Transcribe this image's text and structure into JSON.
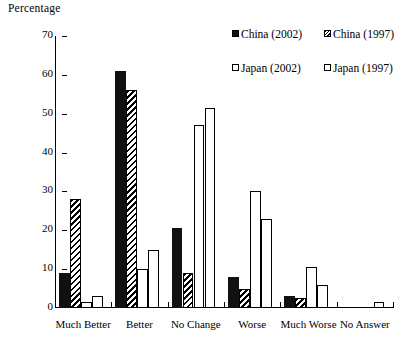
{
  "chart_data": {
    "type": "bar",
    "title": "",
    "ylabel": "Percentage",
    "xlabel": "",
    "ylim": [
      0,
      70
    ],
    "yticks": [
      0,
      10,
      20,
      30,
      40,
      50,
      60,
      70
    ],
    "grid": false,
    "legend_position": "top-right",
    "categories": [
      "Much Better",
      "Better",
      "No Change",
      "Worse",
      "Much Worse",
      "No Answer"
    ],
    "series": [
      {
        "name": "China (2002)",
        "pattern": "solid-black",
        "values": [
          9,
          61,
          20.5,
          8,
          3,
          0
        ]
      },
      {
        "name": "China (1997)",
        "pattern": "diagonal-hatch",
        "values": [
          28,
          56,
          9,
          5,
          2.5,
          0
        ]
      },
      {
        "name": "Japan (2002)",
        "pattern": "open-white",
        "values": [
          1.5,
          10,
          47,
          30,
          10.5,
          0
        ]
      },
      {
        "name": "Japan (1997)",
        "pattern": "dotted",
        "values": [
          3,
          15,
          51.5,
          23,
          6,
          1.5
        ]
      }
    ]
  },
  "axis": {
    "y_title": "Percentage",
    "y_tick_labels": [
      "70",
      "60",
      "50",
      "40",
      "30",
      "20",
      "10",
      "0"
    ]
  },
  "legend": {
    "items": [
      {
        "label": "China (2002)"
      },
      {
        "label": "China (1997)"
      },
      {
        "label": "Japan (2002)"
      },
      {
        "label": "Japan (1997)"
      }
    ]
  },
  "colors": {
    "ink": "#000000",
    "bar_black": "#111111",
    "background": "#ffffff"
  }
}
